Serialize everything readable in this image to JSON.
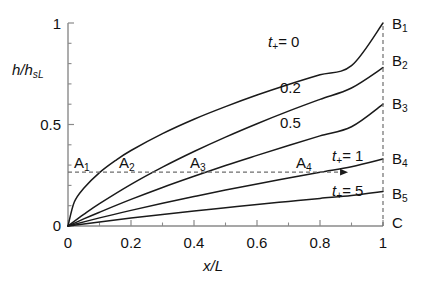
{
  "chart_data": {
    "type": "line",
    "title": "",
    "xlabel": "x/L",
    "ylabel": "h/h_sL",
    "xlim": [
      0,
      1
    ],
    "ylim": [
      0,
      1
    ],
    "grid": false,
    "legend": "inline-curve-labels",
    "x_ticks": [
      "0",
      "0.2",
      "0.4",
      "0.6",
      "0.8",
      "1"
    ],
    "x_tick_values": [
      0,
      0.2,
      0.4,
      0.6,
      0.8,
      1
    ],
    "x_minor_ticks": [
      0.1,
      0.3,
      0.5,
      0.7,
      0.9
    ],
    "y_ticks": [
      "0",
      "0.5",
      "1"
    ],
    "y_tick_values": [
      0,
      0.5,
      1
    ],
    "y_minor_ticks": [
      0.1,
      0.2,
      0.3,
      0.4,
      0.6,
      0.7,
      0.8,
      0.9
    ],
    "series": [
      {
        "name": "t+ = 0",
        "label": "t+= 0",
        "end_label": "B1",
        "endpoint": [
          1,
          1.0
        ],
        "x": [
          0,
          0.02,
          0.05,
          0.1,
          0.15,
          0.2,
          0.3,
          0.4,
          0.5,
          0.6,
          0.7,
          0.8,
          0.9,
          1.0
        ],
        "values": [
          0,
          0.118,
          0.186,
          0.263,
          0.322,
          0.372,
          0.455,
          0.526,
          0.588,
          0.645,
          0.697,
          0.745,
          0.79,
          1.0
        ]
      },
      {
        "name": "t+ = 0.2",
        "label": "0.2",
        "end_label": "B2",
        "endpoint": [
          1,
          0.78
        ],
        "x": [
          0,
          0.05,
          0.1,
          0.2,
          0.3,
          0.4,
          0.5,
          0.6,
          0.7,
          0.8,
          0.9,
          1.0
        ],
        "values": [
          0,
          0.057,
          0.11,
          0.205,
          0.29,
          0.367,
          0.438,
          0.504,
          0.566,
          0.624,
          0.68,
          0.78
        ]
      },
      {
        "name": "t+ = 0.5",
        "label": "0.5",
        "end_label": "B3",
        "endpoint": [
          1,
          0.6
        ],
        "x": [
          0,
          0.05,
          0.1,
          0.2,
          0.3,
          0.4,
          0.5,
          0.6,
          0.7,
          0.8,
          0.9,
          1.0
        ],
        "values": [
          0,
          0.035,
          0.068,
          0.131,
          0.19,
          0.245,
          0.298,
          0.348,
          0.397,
          0.444,
          0.489,
          0.6
        ]
      },
      {
        "name": "t+ = 1",
        "label": "t+= 1",
        "end_label": "B4",
        "endpoint": [
          1,
          0.33
        ],
        "x": [
          0,
          0.1,
          0.2,
          0.3,
          0.4,
          0.5,
          0.6,
          0.7,
          0.8,
          0.9,
          1.0
        ],
        "values": [
          0,
          0.04,
          0.077,
          0.112,
          0.145,
          0.177,
          0.207,
          0.236,
          0.265,
          0.292,
          0.33
        ]
      },
      {
        "name": "t+ = 5",
        "label": "t+= 5",
        "end_label": "B5",
        "endpoint": [
          1,
          0.17
        ],
        "x": [
          0,
          0.1,
          0.2,
          0.3,
          0.4,
          0.5,
          0.6,
          0.7,
          0.8,
          0.9,
          1.0
        ],
        "values": [
          0,
          0.02,
          0.039,
          0.057,
          0.074,
          0.09,
          0.106,
          0.121,
          0.136,
          0.15,
          0.17
        ]
      }
    ],
    "reference_line": {
      "type": "horizontal-dashed-with-arrow",
      "y": 0.265,
      "x_from": 0.0,
      "x_to": 0.87
    },
    "right_boundary": {
      "type": "vertical-dashed",
      "x": 1.0,
      "y_from": 0.0,
      "y_to": 1.0
    },
    "intersection_points": [
      {
        "label": "A1",
        "x": 0.105,
        "y": 0.265,
        "series": "t+ = 0"
      },
      {
        "label": "A2",
        "x": 0.225,
        "y": 0.265,
        "series": "t+ = 0.2"
      },
      {
        "label": "A3",
        "x": 0.435,
        "y": 0.265,
        "series": "t+ = 0.5"
      },
      {
        "label": "A4",
        "x": 0.795,
        "y": 0.265,
        "series": "t+ = 1"
      }
    ],
    "endpoint_labels": [
      "B1",
      "B2",
      "B3",
      "B4",
      "B5",
      "C"
    ],
    "bottom_right_label": "C"
  },
  "axes": {
    "y_label_main": "h/h",
    "y_label_sub": "sL",
    "x_label_main": "x/L",
    "y_tick_top": "1",
    "y_tick_mid": "0.5",
    "y_tick_bot": "0",
    "x_tick_0": "0",
    "x_tick_1": "0.2",
    "x_tick_2": "0.4",
    "x_tick_3": "0.6",
    "x_tick_4": "0.8",
    "x_tick_5": "1"
  },
  "curve_labels": {
    "c1_var": "t",
    "c1_sub": "+",
    "c1_eq": "= 0",
    "c2": "0.2",
    "c3": "0.5",
    "c4_var": "t",
    "c4_sub": "+",
    "c4_eq": "= 1",
    "c5_var": "t",
    "c5_sub": "+",
    "c5_eq": "= 5"
  },
  "point_labels": {
    "a1": "A",
    "a1s": "1",
    "a2": "A",
    "a2s": "2",
    "a3": "A",
    "a3s": "3",
    "a4": "A",
    "a4s": "4",
    "b1": "B",
    "b1s": "1",
    "b2": "B",
    "b2s": "2",
    "b3": "B",
    "b3s": "3",
    "b4": "B",
    "b4s": "4",
    "b5": "B",
    "b5s": "5",
    "c": "C"
  },
  "colors": {
    "curve": "#1a1a1a",
    "axis": "#8a8a8a",
    "dashed": "#6e6e6e",
    "text": "#111111",
    "background": "#ffffff"
  }
}
